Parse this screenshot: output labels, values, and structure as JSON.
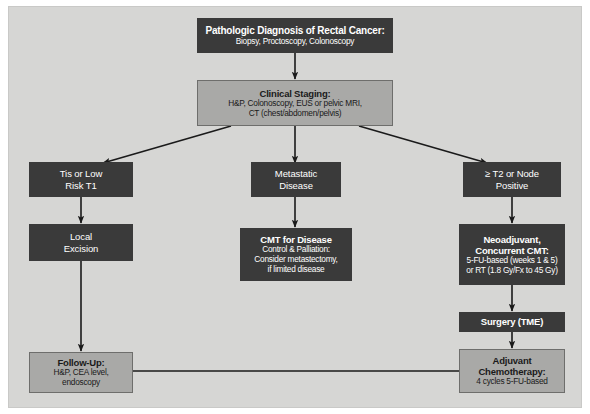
{
  "diagram": {
    "type": "flowchart",
    "background_color": "#d6d6d4",
    "dark_node_color": "#3a3a3a",
    "gray_node_color": "#a9a9a7",
    "connector_color": "#1a1a1a"
  },
  "nodes": {
    "pathologic_diagnosis": {
      "style": "dark",
      "title": "Pathologic Diagnosis of Rectal Cancer:",
      "sub1": "Biopsy, Proctoscopy, Colonoscopy"
    },
    "clinical_staging": {
      "style": "gray",
      "title": "Clinical Staging:",
      "sub1": "H&P, Colonoscopy, EUS or pelvic MRI,",
      "sub2": "CT (chest/abdomen/pelvis)"
    },
    "tis_low_risk": {
      "style": "dark",
      "line1": "Tis or Low",
      "line2": "Risk T1"
    },
    "local_excision": {
      "style": "dark",
      "line1": "Local",
      "line2": "Excision"
    },
    "metastatic_disease": {
      "style": "dark",
      "line1": "Metastatic",
      "line2": "Disease"
    },
    "cmt_for_disease": {
      "style": "dark",
      "title": "CMT for Disease",
      "sub1": "Control & Palliation:",
      "sub2": "Consider metastectomy,",
      "sub3": "if limited disease"
    },
    "t2_or_node_positive": {
      "style": "dark",
      "line1": "≥ T2 or Node",
      "line2": "Positive"
    },
    "neoadjuvant_cmt": {
      "style": "dark",
      "title1": "Neoadjuvant,",
      "title2": "Concurrent CMT:",
      "sub1": "5-FU-based (weeks 1 & 5)",
      "sub2": "or RT (1.8 Gy/Fx to 45 Gy)"
    },
    "surgery_tme": {
      "style": "dark",
      "title": "Surgery (TME)"
    },
    "adjuvant_chemotherapy": {
      "style": "gray",
      "title1": "Adjuvant",
      "title2": "Chemotherapy:",
      "sub1": "4 cycles 5-FU-based"
    },
    "follow_up": {
      "style": "gray",
      "title": "Follow-Up:",
      "sub1": "H&P, CEA level,",
      "sub2": "endoscopy"
    }
  }
}
